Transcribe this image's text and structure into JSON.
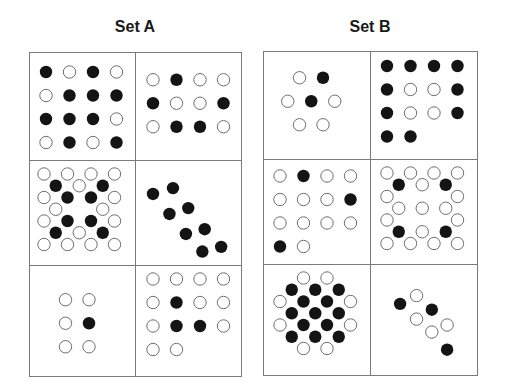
{
  "sets": [
    {
      "title": "Set A",
      "cells": [
        {
          "label": "A1",
          "dots": [
            [
              0,
              0,
              1
            ],
            [
              1,
              0,
              0
            ],
            [
              2,
              0,
              1
            ],
            [
              3,
              0,
              0
            ],
            [
              0,
              1,
              0
            ],
            [
              1,
              1,
              1
            ],
            [
              2,
              1,
              1
            ],
            [
              3,
              1,
              1
            ],
            [
              0,
              2,
              1
            ],
            [
              1,
              2,
              1
            ],
            [
              2,
              2,
              1
            ],
            [
              3,
              2,
              0
            ],
            [
              0,
              3,
              0
            ],
            [
              1,
              3,
              1
            ],
            [
              2,
              3,
              0
            ],
            [
              3,
              3,
              1
            ]
          ]
        },
        {
          "label": "A2",
          "dots": [
            [
              0,
              0.5,
              0
            ],
            [
              1,
              0.5,
              1
            ],
            [
              2,
              0.5,
              0
            ],
            [
              3,
              0.5,
              0
            ],
            [
              0,
              1.5,
              1
            ],
            [
              1,
              1.5,
              0
            ],
            [
              2,
              1.5,
              0
            ],
            [
              3,
              1.5,
              1
            ],
            [
              0,
              2.5,
              0
            ],
            [
              1,
              2.5,
              1
            ],
            [
              2,
              2.5,
              1
            ],
            [
              3,
              2.5,
              0
            ]
          ]
        },
        {
          "label": "A3",
          "dots": [
            [
              0,
              0,
              0
            ],
            [
              1,
              0,
              0
            ],
            [
              2,
              0,
              0
            ],
            [
              3,
              0,
              0
            ],
            [
              0.5,
              0.5,
              1
            ],
            [
              1.5,
              0.5,
              0
            ],
            [
              2.5,
              0.5,
              1
            ],
            [
              0,
              1,
              0
            ],
            [
              1,
              1,
              1
            ],
            [
              2,
              1,
              1
            ],
            [
              3,
              1,
              0
            ],
            [
              0.5,
              1.5,
              0
            ],
            [
              2.5,
              1.5,
              0
            ],
            [
              0,
              2,
              0
            ],
            [
              1,
              2,
              1
            ],
            [
              2,
              2,
              1
            ],
            [
              3,
              2,
              0
            ],
            [
              0.5,
              2.5,
              1
            ],
            [
              1.5,
              2.5,
              0
            ],
            [
              2.5,
              2.5,
              1
            ],
            [
              0,
              3,
              0
            ],
            [
              1,
              3,
              0
            ],
            [
              2,
              3,
              0
            ],
            [
              3,
              3,
              0
            ]
          ]
        },
        {
          "label": "A4",
          "dots": [
            [
              0,
              0.85,
              1
            ],
            [
              0.85,
              0.6,
              1
            ],
            [
              0.7,
              1.7,
              1
            ],
            [
              1.5,
              1.45,
              1
            ],
            [
              1.4,
              2.55,
              1
            ],
            [
              2.2,
              2.35,
              1
            ],
            [
              2.1,
              3.3,
              1
            ],
            [
              2.9,
              3.1,
              1
            ]
          ]
        },
        {
          "label": "A5",
          "dots": [
            [
              1,
              0.5,
              0
            ],
            [
              2,
              0.5,
              0
            ],
            [
              1,
              1.5,
              0
            ],
            [
              2,
              1.5,
              1
            ],
            [
              1,
              2.5,
              0
            ],
            [
              2,
              2.5,
              0
            ]
          ]
        },
        {
          "label": "A6",
          "dots": [
            [
              0,
              0,
              0
            ],
            [
              1,
              0,
              0
            ],
            [
              2,
              0,
              0
            ],
            [
              3,
              0,
              0
            ],
            [
              0,
              1,
              0
            ],
            [
              1,
              1,
              1
            ],
            [
              2,
              1,
              0
            ],
            [
              3,
              1,
              0
            ],
            [
              0,
              2,
              0
            ],
            [
              1,
              2,
              1
            ],
            [
              2,
              2,
              1
            ],
            [
              3,
              2,
              0
            ],
            [
              0,
              3,
              0
            ],
            [
              1,
              3,
              0
            ]
          ]
        }
      ]
    },
    {
      "title": "Set B",
      "cells": [
        {
          "label": "B1",
          "dots": [
            [
              1,
              0.5,
              0
            ],
            [
              2,
              0.5,
              1
            ],
            [
              0.5,
              1.5,
              0
            ],
            [
              1.5,
              1.5,
              1
            ],
            [
              2.5,
              1.5,
              0
            ],
            [
              1,
              2.5,
              0
            ],
            [
              2,
              2.5,
              0
            ]
          ]
        },
        {
          "label": "B2",
          "dots": [
            [
              0,
              0,
              1
            ],
            [
              1,
              0,
              1
            ],
            [
              2,
              0,
              1
            ],
            [
              3,
              0,
              1
            ],
            [
              0,
              1,
              1
            ],
            [
              1,
              1,
              0
            ],
            [
              2,
              1,
              0
            ],
            [
              3,
              1,
              1
            ],
            [
              0,
              2,
              1
            ],
            [
              1,
              2,
              0
            ],
            [
              2,
              2,
              0
            ],
            [
              3,
              2,
              1
            ],
            [
              0,
              3,
              1
            ],
            [
              1,
              3,
              1
            ]
          ]
        },
        {
          "label": "B3",
          "dots": [
            [
              0,
              0,
              0
            ],
            [
              1,
              0,
              1
            ],
            [
              2,
              0,
              0
            ],
            [
              3,
              0,
              0
            ],
            [
              0,
              1,
              0
            ],
            [
              1,
              1,
              0
            ],
            [
              2,
              1,
              0
            ],
            [
              3,
              1,
              1
            ],
            [
              0,
              2,
              0
            ],
            [
              1,
              2,
              0
            ],
            [
              2,
              2,
              0
            ],
            [
              3,
              2,
              0
            ],
            [
              0,
              3,
              1
            ],
            [
              1,
              3,
              0
            ]
          ]
        },
        {
          "label": "B4",
          "dots": [
            [
              0,
              0,
              0
            ],
            [
              1,
              0,
              0
            ],
            [
              2,
              0,
              0
            ],
            [
              3,
              0,
              0
            ],
            [
              0.5,
              0.5,
              1
            ],
            [
              1.5,
              0.5,
              0
            ],
            [
              2.5,
              0.5,
              1
            ],
            [
              0,
              1,
              0
            ],
            [
              3,
              1,
              0
            ],
            [
              0.5,
              1.5,
              0
            ],
            [
              1.5,
              1.5,
              0
            ],
            [
              2.5,
              1.5,
              0
            ],
            [
              0,
              2,
              0
            ],
            [
              3,
              2,
              0
            ],
            [
              0.5,
              2.5,
              1
            ],
            [
              1.5,
              2.5,
              0
            ],
            [
              2.5,
              2.5,
              1
            ],
            [
              0,
              3,
              0
            ],
            [
              1,
              3,
              0
            ],
            [
              2,
              3,
              0
            ],
            [
              3,
              3,
              0
            ]
          ]
        },
        {
          "label": "B5",
          "dots": [
            [
              1,
              0,
              0
            ],
            [
              2,
              0,
              0
            ],
            [
              0.5,
              0.5,
              1
            ],
            [
              1.5,
              0.5,
              1
            ],
            [
              2.5,
              0.5,
              1
            ],
            [
              0,
              1,
              0
            ],
            [
              1,
              1,
              1
            ],
            [
              2,
              1,
              1
            ],
            [
              3,
              1,
              0
            ],
            [
              0.5,
              1.5,
              1
            ],
            [
              1.5,
              1.5,
              1
            ],
            [
              2.5,
              1.5,
              1
            ],
            [
              0,
              2,
              0
            ],
            [
              1,
              2,
              1
            ],
            [
              2,
              2,
              1
            ],
            [
              3,
              2,
              0
            ],
            [
              0.5,
              2.5,
              1
            ],
            [
              1.5,
              2.5,
              1
            ],
            [
              2.5,
              2.5,
              1
            ],
            [
              1,
              3,
              0
            ],
            [
              2,
              3,
              0
            ]
          ]
        },
        {
          "label": "B6",
          "dots": [
            [
              0.6,
              1.1,
              1
            ],
            [
              1.3,
              0.75,
              0
            ],
            [
              1.95,
              1.35,
              1
            ],
            [
              1.3,
              1.75,
              0
            ],
            [
              2.6,
              2.0,
              0
            ],
            [
              1.95,
              2.3,
              0
            ],
            [
              2.6,
              3.05,
              1
            ]
          ]
        }
      ]
    }
  ],
  "colors": {
    "filled": "#141414",
    "open_stroke": "#6e6e6e",
    "border": "#7a7a7a"
  }
}
